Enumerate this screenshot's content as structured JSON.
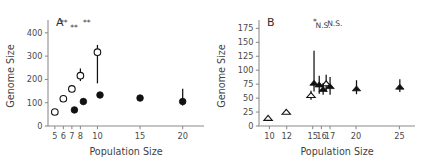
{
  "figure": {
    "panels": [
      "A",
      "B"
    ],
    "shared_xlabel": "Population Size",
    "shared_ylabel": "Genome Size"
  },
  "chart_data": [
    {
      "type": "scatter",
      "panel_label": "A",
      "title": "",
      "xlabel": "Population Size",
      "ylabel": "Genome Size",
      "xlim": [
        4.2,
        22.5
      ],
      "ylim": [
        0,
        455
      ],
      "xticks": [
        5,
        6,
        7,
        8,
        10,
        15,
        20
      ],
      "xtick_labels": [
        "5",
        "6",
        "7",
        "8",
        "10",
        "15",
        "20"
      ],
      "yticks": [
        0,
        100,
        200,
        300,
        400
      ],
      "ytick_labels": [
        "0",
        "100",
        "200",
        "300",
        "400"
      ],
      "grid": false,
      "legend": "none",
      "series": [
        {
          "name": "open-circles",
          "marker": "circle-open",
          "points": [
            {
              "x": 5.0,
              "y": 60,
              "err_low": 60,
              "err_high": 60
            },
            {
              "x": 6.0,
              "y": 117,
              "err_low": 106,
              "err_high": 128
            },
            {
              "x": 7.0,
              "y": 159,
              "err_low": 152,
              "err_high": 166
            },
            {
              "x": 8.0,
              "y": 216,
              "err_low": 193,
              "err_high": 247
            },
            {
              "x": 10.0,
              "y": 317,
              "err_low": 183,
              "err_high": 348
            }
          ]
        },
        {
          "name": "filled-circles",
          "marker": "circle-filled",
          "points": [
            {
              "x": 7.3,
              "y": 69,
              "err_low": 60,
              "err_high": 80
            },
            {
              "x": 8.35,
              "y": 105,
              "err_low": 92,
              "err_high": 120
            },
            {
              "x": 10.3,
              "y": 133,
              "err_low": 124,
              "err_high": 143
            },
            {
              "x": 15.0,
              "y": 120,
              "err_low": 110,
              "err_high": 132
            },
            {
              "x": 20.0,
              "y": 105,
              "err_low": 88,
              "err_high": 160
            }
          ]
        }
      ],
      "annotations": [
        {
          "text": "**",
          "x": 6.05,
          "y": 433
        },
        {
          "text": "**",
          "x": 7.25,
          "y": 412
        },
        {
          "text": "**",
          "x": 8.75,
          "y": 433
        }
      ]
    },
    {
      "type": "scatter",
      "panel_label": "B",
      "title": "",
      "xlabel": "Population Size",
      "ylabel": "Genome Size",
      "xlim": [
        8.8,
        26.8
      ],
      "ylim": [
        0,
        190
      ],
      "xticks": [
        10,
        12,
        15,
        16,
        17,
        20,
        25
      ],
      "xtick_labels": [
        "10",
        "12",
        "15",
        "16",
        "17",
        "20",
        "25"
      ],
      "yticks": [
        0,
        25,
        50,
        75,
        100,
        125,
        150,
        175
      ],
      "ytick_labels": [
        "0",
        "25",
        "50",
        "75",
        "100",
        "125",
        "150",
        "175"
      ],
      "grid": false,
      "legend": "none",
      "series": [
        {
          "name": "open-triangles",
          "marker": "triangle-open",
          "points": [
            {
              "x": 9.85,
              "y": 14,
              "err_low": 14,
              "err_high": 14
            },
            {
              "x": 11.95,
              "y": 25,
              "err_low": 22,
              "err_high": 30
            },
            {
              "x": 14.8,
              "y": 55,
              "err_low": 47,
              "err_high": 63
            },
            {
              "x": 16.55,
              "y": 76,
              "err_low": 62,
              "err_high": 92
            }
          ]
        },
        {
          "name": "filled-triangles",
          "marker": "triangle-filled",
          "points": [
            {
              "x": 15.15,
              "y": 77,
              "err_low": 62,
              "err_high": 135
            },
            {
              "x": 15.75,
              "y": 74,
              "err_low": 58,
              "err_high": 90
            },
            {
              "x": 16.2,
              "y": 66,
              "err_low": 56,
              "err_high": 77
            },
            {
              "x": 17.0,
              "y": 71,
              "err_low": 56,
              "err_high": 88
            },
            {
              "x": 20.05,
              "y": 67,
              "err_low": 57,
              "err_high": 82
            },
            {
              "x": 25.05,
              "y": 70,
              "err_low": 61,
              "err_high": 84
            }
          ]
        }
      ],
      "annotations": [
        {
          "text": "*",
          "x": 15.25,
          "y": 182
        },
        {
          "text": "N.S.",
          "x": 16.2,
          "y": 176
        },
        {
          "text": "N.S.",
          "x": 17.55,
          "y": 180
        }
      ]
    }
  ]
}
